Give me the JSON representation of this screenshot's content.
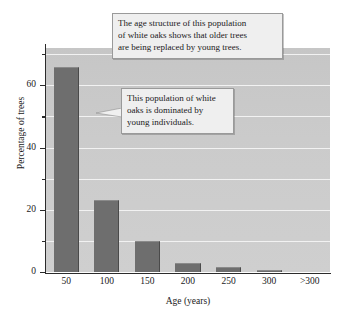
{
  "chart_data": {
    "type": "bar",
    "title": "",
    "subtitle": "",
    "xlabel": "Age (years)",
    "ylabel": "Percentage of trees",
    "categories": [
      "50",
      "100",
      "150",
      "200",
      "250",
      "300",
      ">300"
    ],
    "values": [
      66,
      23,
      10,
      3,
      1.5,
      0.5,
      0
    ],
    "ylim": [
      0,
      72
    ],
    "y_ticks_major": [
      0,
      20,
      40,
      60
    ],
    "y_tick_labels": [
      "0",
      "20",
      "40",
      "60"
    ],
    "y_ticks_minor": [
      10,
      30,
      50,
      70
    ],
    "gridlines": [
      10,
      20,
      30,
      40,
      50,
      60,
      70
    ],
    "grid": true,
    "legend": null,
    "bar_color": "#6e6e6e",
    "plot_background": "#c9c9c9",
    "gridline_color": "#f2f2f2",
    "annotations": [
      {
        "id": "callout-1",
        "lines": [
          "The age structure of this population",
          "of white oaks shows that older trees",
          "are being replaced by young trees."
        ]
      },
      {
        "id": "callout-2",
        "lines": [
          "This population of white",
          "oaks is dominated by",
          "young individuals."
        ]
      }
    ]
  }
}
